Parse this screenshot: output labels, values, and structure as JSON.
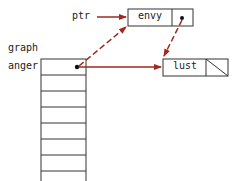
{
  "labels": {
    "ptr": "ptr",
    "graph": "graph",
    "anger": "anger"
  },
  "nodes": {
    "envy": {
      "value": "envy"
    },
    "lust": {
      "value": "lust"
    }
  },
  "colors": {
    "arrow": "#a0281e",
    "line": "#333333"
  },
  "array": {
    "rows": 8
  }
}
